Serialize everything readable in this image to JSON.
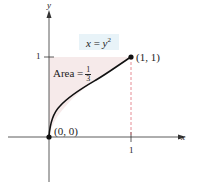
{
  "figure": {
    "equation": {
      "lhs": "x",
      "eq": " = ",
      "base": "y",
      "exp": "2"
    },
    "area_label": {
      "text": "Area =",
      "num": "1",
      "den": "3"
    },
    "axes": {
      "x_label": "x",
      "y_label": "y",
      "x_tick": "1",
      "y_tick": "1"
    },
    "points": [
      {
        "label": "(0, 0)",
        "x": 0,
        "y": 0
      },
      {
        "label": "(1, 1)",
        "x": 1,
        "y": 1
      }
    ],
    "colors": {
      "shade": "#f6eaea",
      "curve": "#111111",
      "dash": "#e0707a",
      "axis": "#333333",
      "eq_box": "#e8f3f8"
    }
  }
}
